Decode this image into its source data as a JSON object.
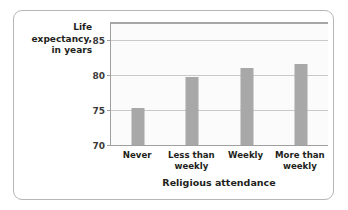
{
  "chart_data": {
    "type": "bar",
    "title": "",
    "categories": [
      "Never",
      "Less than weekly",
      "Weekly",
      "More than weekly"
    ],
    "values": [
      75.3,
      79.8,
      81.0,
      81.6
    ],
    "xlabel": "Religious attendance",
    "ylabel": "Life expectancy, in years",
    "ylim": [
      70,
      87.5
    ],
    "yticks": [
      70,
      75,
      80,
      85
    ],
    "ytick_labels": [
      "70",
      "75",
      "80",
      "85"
    ],
    "grid": true,
    "legend": false,
    "bar_color": "#a8a8a8",
    "plot_background": "#fbfbfb",
    "gridline_color": "#c9c9c9",
    "axis_color": "#9f9f9f"
  },
  "y_axis_title_lines": [
    "Life",
    "expectancy,",
    "in years"
  ],
  "category_label_lines": [
    [
      "Never"
    ],
    [
      "Less than",
      "weekly"
    ],
    [
      "Weekly"
    ],
    [
      "More than",
      "weekly"
    ]
  ]
}
